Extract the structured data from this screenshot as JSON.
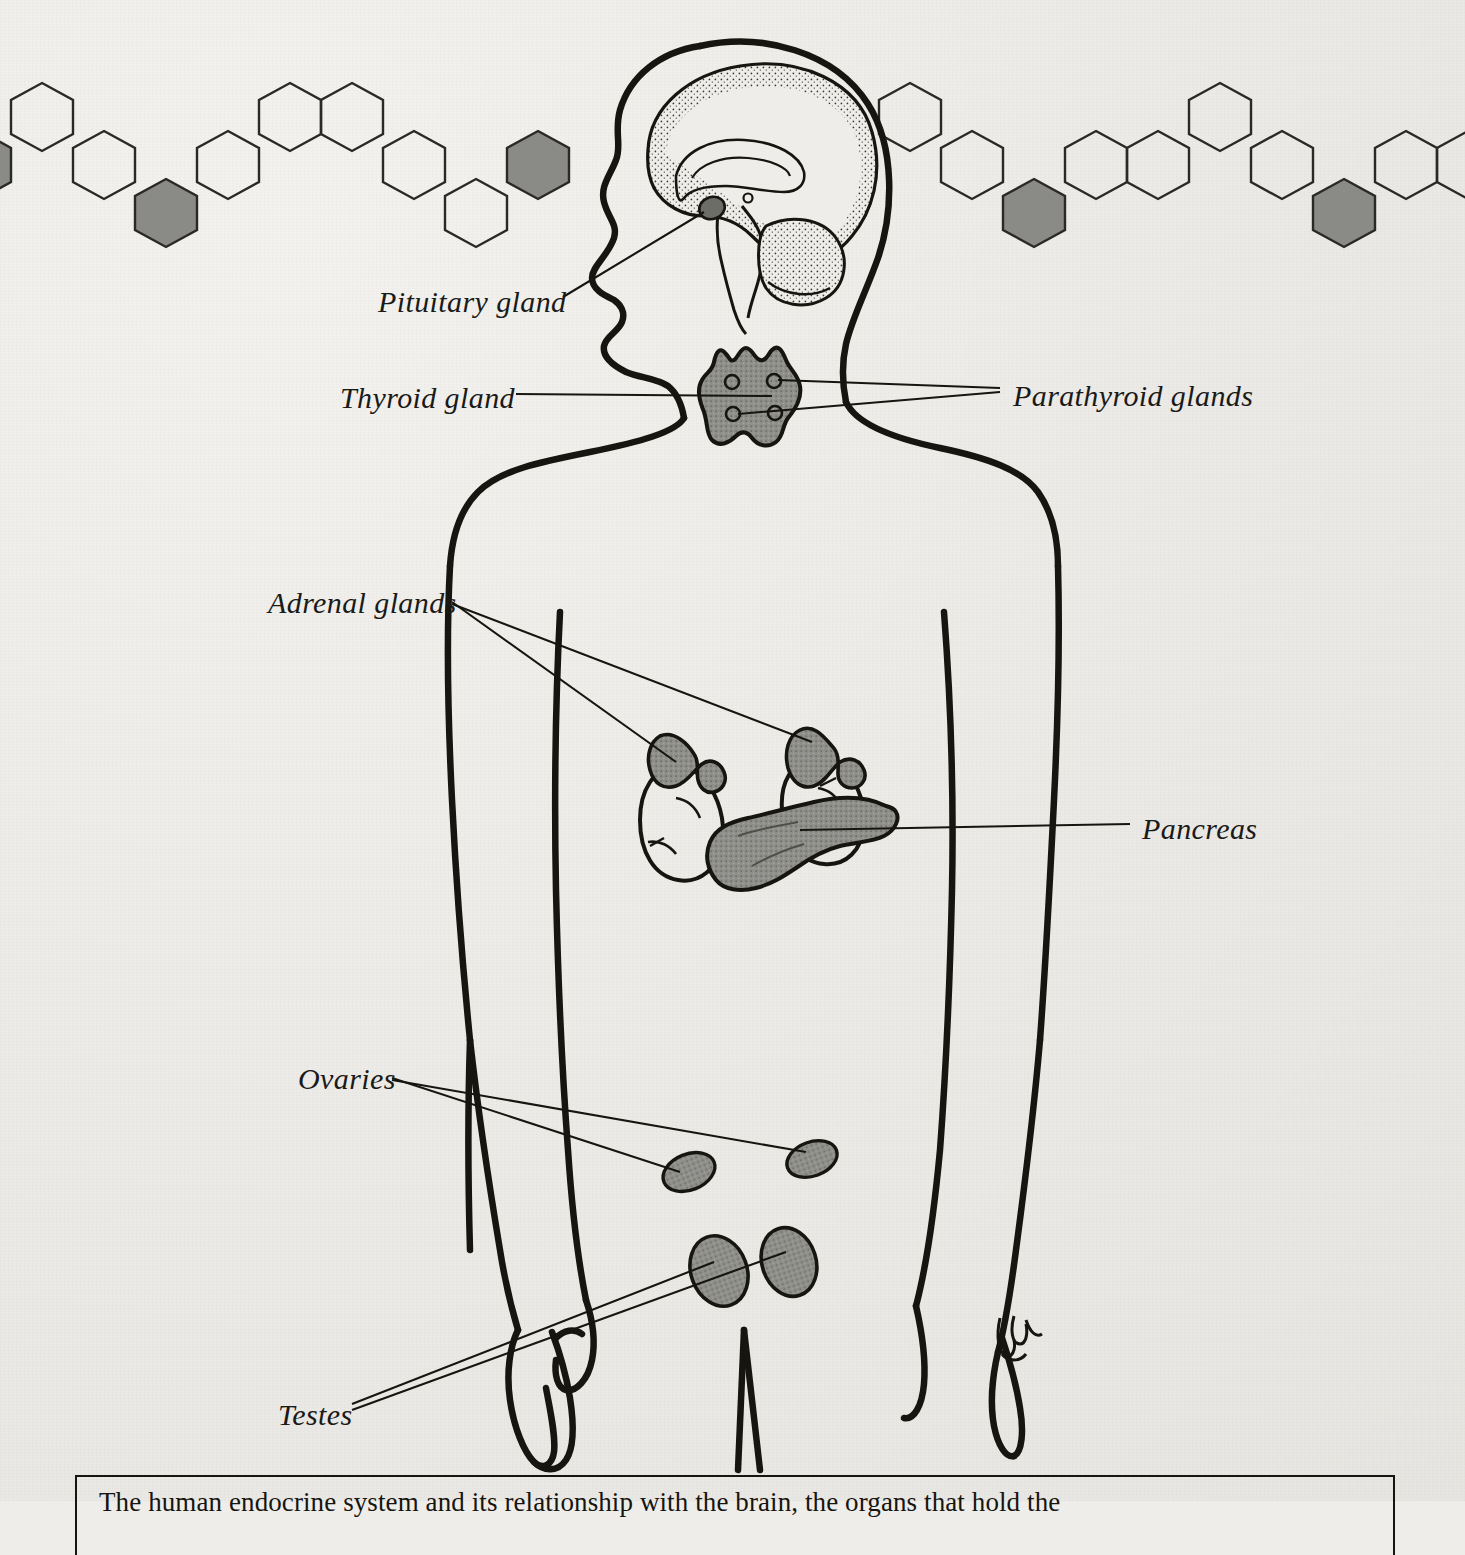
{
  "figure": {
    "kind": "anatomical-diagram",
    "background_color": "#eeedea",
    "ink_color": "#16150f",
    "gland_fill_color": "#8b8b88",
    "border_motif": "hexagon-chain"
  },
  "labels": [
    {
      "id": "pituitary",
      "text": "Pituitary gland",
      "x": 378,
      "y": 285
    },
    {
      "id": "thyroid",
      "text": "Thyroid gland",
      "x": 340,
      "y": 381
    },
    {
      "id": "parathyroid",
      "text": "Parathyroid glands",
      "x": 1013,
      "y": 379
    },
    {
      "id": "adrenal",
      "text": "Adrenal glands",
      "x": 268,
      "y": 586
    },
    {
      "id": "pancreas",
      "text": "Pancreas",
      "x": 1142,
      "y": 812
    },
    {
      "id": "ovaries",
      "text": "Ovaries",
      "x": 298,
      "y": 1062
    },
    {
      "id": "testes",
      "text": "Testes",
      "x": 278,
      "y": 1398
    }
  ],
  "organs": [
    {
      "id": "brain",
      "name": "brain-sagittal-section"
    },
    {
      "id": "pituitary",
      "name": "pituitary-gland"
    },
    {
      "id": "thyroid",
      "name": "thyroid-gland"
    },
    {
      "id": "parathyroid",
      "name": "parathyroid-glands",
      "count": 4
    },
    {
      "id": "kidneys",
      "name": "kidneys",
      "count": 2
    },
    {
      "id": "adrenals",
      "name": "adrenal-glands",
      "count": 2
    },
    {
      "id": "pancreas",
      "name": "pancreas"
    },
    {
      "id": "ovaries",
      "name": "ovaries",
      "count": 2
    },
    {
      "id": "testes",
      "name": "testes",
      "count": 2
    }
  ],
  "signature": {
    "text": "JML",
    "x": 1005,
    "y": 1330
  },
  "caption": {
    "line1": "The human endocrine system and its relationship with the brain, the organs that hold the"
  }
}
